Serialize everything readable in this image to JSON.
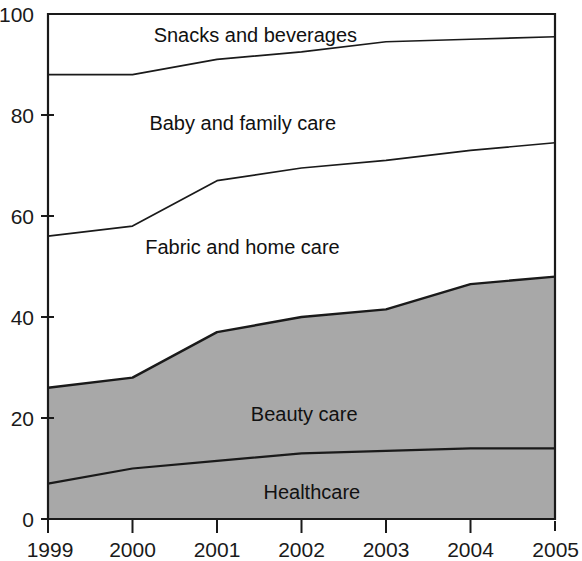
{
  "chart_data": {
    "type": "area",
    "stacked": true,
    "title": "",
    "subtitle": "",
    "xlabel": "",
    "ylabel": "",
    "grid": false,
    "legend_position": "inline-labels",
    "categories": [
      "1999",
      "2000",
      "2001",
      "2002",
      "2003",
      "2004",
      "2005"
    ],
    "x": [
      1999,
      2000,
      2001,
      2002,
      2003,
      2004,
      2005
    ],
    "xlim": [
      1999,
      2005
    ],
    "ylim": [
      0,
      100
    ],
    "y_ticks": [
      0,
      20,
      40,
      60,
      80,
      100
    ],
    "y_tick_labels": [
      "0",
      "20",
      "40",
      "60",
      "80",
      "100"
    ],
    "x_tick_labels": [
      "1999",
      "2000",
      "2001",
      "2002",
      "2003",
      "2004",
      "2005"
    ],
    "series": [
      {
        "name": "Healthcare",
        "shaded": true,
        "fill": "#a8a8a8",
        "label_x": 2001.55,
        "label_y": 4.0,
        "values": [
          7,
          10,
          11.5,
          13,
          13.5,
          14,
          14
        ],
        "cumulative": [
          7,
          10,
          11.5,
          13,
          13.5,
          14,
          14
        ]
      },
      {
        "name": "Beauty care",
        "shaded": true,
        "fill": "#a8a8a8",
        "label_x": 2001.4,
        "label_y": 19.5,
        "values": [
          19,
          18,
          25.5,
          27,
          28,
          32.5,
          34
        ],
        "cumulative": [
          26,
          28,
          37,
          40,
          41.5,
          46.5,
          48
        ]
      },
      {
        "name": "Fabric and home care",
        "shaded": false,
        "fill": "#ffffff",
        "label_x": 2000.15,
        "label_y": 52.5,
        "values": [
          30,
          30,
          30,
          29.5,
          29.5,
          26.5,
          26.5
        ],
        "cumulative": [
          56,
          58,
          67,
          69.5,
          71,
          73,
          74.5
        ]
      },
      {
        "name": "Baby and family care",
        "shaded": false,
        "fill": "#ffffff",
        "label_x": 2000.2,
        "label_y": 77.0,
        "values": [
          32,
          30,
          24,
          23,
          23.5,
          22,
          21
        ],
        "cumulative": [
          88,
          88,
          91,
          92.5,
          94.5,
          95,
          95.5
        ]
      },
      {
        "name": "Snacks and beverages",
        "shaded": false,
        "fill": "#ffffff",
        "label_x": 2000.25,
        "label_y": 94.5,
        "values": [
          12,
          12,
          9,
          7.5,
          5.5,
          5,
          4.5
        ],
        "cumulative": [
          100,
          100,
          100,
          100,
          100,
          100,
          100
        ]
      }
    ],
    "colors": {
      "shaded_fill": "#a8a8a8",
      "unshaded_fill": "#ffffff",
      "line": "#1a1a1a",
      "axis": "#1a1a1a",
      "text": "#1a1a1a"
    }
  },
  "axes": {
    "plot_left_px": 48,
    "plot_right_px": 555,
    "plot_top_px": 14,
    "plot_bottom_px": 519
  }
}
